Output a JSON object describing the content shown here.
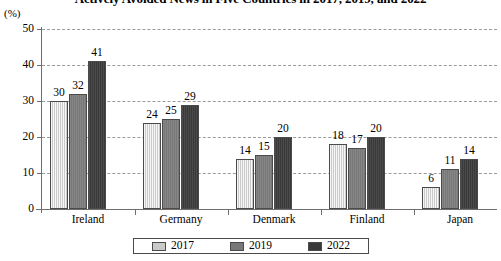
{
  "chart_data": {
    "type": "bar",
    "title": "Actively Avoided News in Five Countries in 2017, 2019, and 2022",
    "xlabel": "",
    "ylabel": "(%)",
    "ylim": [
      0,
      50
    ],
    "yticks": [
      "0",
      "10",
      "20",
      "30",
      "40",
      "50"
    ],
    "grid": true,
    "legend_position": "bottom",
    "categories": [
      "Ireland",
      "Germany",
      "Denmark",
      "Finland",
      "Japan"
    ],
    "series": [
      {
        "name": "2017",
        "color": "#c9c9c9",
        "values": [
          30,
          24,
          14,
          18,
          6
        ]
      },
      {
        "name": "2019",
        "color": "#787878",
        "values": [
          32,
          25,
          15,
          17,
          11
        ]
      },
      {
        "name": "2022",
        "color": "#393939",
        "values": [
          41,
          29,
          20,
          20,
          14
        ]
      }
    ]
  }
}
